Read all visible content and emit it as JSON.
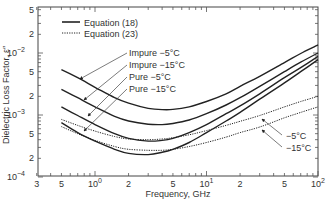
{
  "chart_data": {
    "type": "line",
    "title": "",
    "xlabel": "Frequency, GHz",
    "ylabel": "Dielectric Loss Factor, ε″",
    "xscale": "log",
    "yscale": "log",
    "xlim": [
      0.3,
      100
    ],
    "ylim": [
      0.0001,
      0.05
    ],
    "grid": false,
    "x_ticks": [
      {
        "value": 0.3,
        "label": "3"
      },
      {
        "value": 0.5,
        "label": "5"
      },
      {
        "value": 1,
        "label": "10",
        "exp": "0"
      },
      {
        "value": 2,
        "label": "2"
      },
      {
        "value": 5,
        "label": "5"
      },
      {
        "value": 10,
        "label": "10",
        "exp": "1"
      },
      {
        "value": 20,
        "label": "2"
      },
      {
        "value": 50,
        "label": "5"
      },
      {
        "value": 100,
        "label": "10",
        "exp": "2"
      }
    ],
    "y_ticks": [
      {
        "value": 0.05,
        "label": "5"
      },
      {
        "value": 0.02,
        "label": "2"
      },
      {
        "value": 0.01,
        "label": "10",
        "exp": "−2"
      },
      {
        "value": 0.005,
        "label": "5"
      },
      {
        "value": 0.002,
        "label": "2"
      },
      {
        "value": 0.001,
        "label": "10",
        "exp": "−3"
      },
      {
        "value": 0.0005,
        "label": "5"
      },
      {
        "value": 0.0002,
        "label": "2"
      },
      {
        "value": 0.0001,
        "label": "10",
        "exp": "−4"
      }
    ],
    "legend": {
      "position": "upper-left",
      "entries": [
        {
          "label": "Equation (18)",
          "style": "solid"
        },
        {
          "label": "Equation (23)",
          "style": "dotted"
        }
      ]
    },
    "x": [
      0.5,
      0.7,
      1,
      1.5,
      2,
      3,
      4,
      5,
      7,
      10,
      15,
      20,
      30,
      50,
      70,
      100
    ],
    "series": [
      {
        "name": "Impure −5°C",
        "equation": "Equation (18)",
        "style": "solid",
        "values": [
          0.0054,
          0.004,
          0.0028,
          0.0019,
          0.00155,
          0.00128,
          0.00122,
          0.00123,
          0.00135,
          0.00165,
          0.0022,
          0.0029,
          0.0042,
          0.007,
          0.0098,
          0.0135
        ]
      },
      {
        "name": "Impure −15°C",
        "equation": "Equation (18)",
        "style": "solid",
        "values": [
          0.0026,
          0.0019,
          0.00135,
          0.00095,
          0.0008,
          0.00071,
          0.0007,
          0.00073,
          0.00083,
          0.00105,
          0.00145,
          0.0019,
          0.0029,
          0.005,
          0.0071,
          0.01
        ]
      },
      {
        "name": "Pure −5°C",
        "equation": "Equation (18)",
        "style": "solid",
        "values": [
          0.00135,
          0.00098,
          0.0007,
          0.0005,
          0.00042,
          0.00038,
          0.00039,
          0.00042,
          0.00052,
          0.0007,
          0.00105,
          0.0014,
          0.0022,
          0.004,
          0.0058,
          0.0088
        ]
      },
      {
        "name": "Pure −15°C",
        "equation": "Equation (18)",
        "style": "solid",
        "values": [
          0.00075,
          0.00052,
          0.00038,
          0.00028,
          0.00024,
          0.00023,
          0.00025,
          0.00028,
          0.00036,
          0.00052,
          0.0008,
          0.0011,
          0.0018,
          0.0033,
          0.005,
          0.0078
        ]
      },
      {
        "name": "−5°C",
        "equation": "Equation (23)",
        "style": "dotted",
        "values": [
          0.00085,
          0.00068,
          0.00055,
          0.00045,
          0.00041,
          0.0004,
          0.00041,
          0.00043,
          0.00048,
          0.00056,
          0.00068,
          0.00079,
          0.00098,
          0.00135,
          0.00165,
          0.002
        ]
      },
      {
        "name": "−15°C",
        "equation": "Equation (23)",
        "style": "dotted",
        "values": [
          0.00065,
          0.0005,
          0.00039,
          0.00031,
          0.00028,
          0.00027,
          0.00027,
          0.00028,
          0.00031,
          0.00036,
          0.00044,
          0.00052,
          0.00064,
          0.0009,
          0.0011,
          0.00135
        ]
      }
    ],
    "annotations": [
      {
        "text": "Impure −5°C"
      },
      {
        "text": "Impure −15°C"
      },
      {
        "text": "Pure −5°C"
      },
      {
        "text": "Pure −15°C"
      },
      {
        "text": "−5°C"
      },
      {
        "text": "−15°C"
      }
    ]
  }
}
